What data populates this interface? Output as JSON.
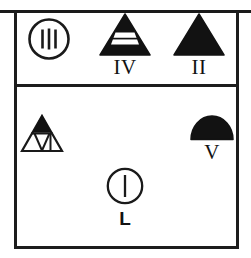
{
  "figure": {
    "type": "symbol-typology-plate",
    "background_color": "#ffffff",
    "ink_color": "#1a1a1a",
    "frame": {
      "name": "outer-frame",
      "has_top_rule": true,
      "has_middle_divider": true,
      "sections": [
        "upper-register",
        "lower-register"
      ]
    },
    "symbols": [
      {
        "id": "iii",
        "glyph": "circle-with-three-bars",
        "label": "",
        "label_style": "none",
        "fill": "outline",
        "register": "upper",
        "bar_count": 3
      },
      {
        "id": "iv",
        "glyph": "triangle-with-white-band",
        "label": "IV",
        "label_style": "serif",
        "fill": "solid-black-with-void-band",
        "register": "upper"
      },
      {
        "id": "ii",
        "glyph": "solid-triangle",
        "label": "II",
        "label_style": "serif",
        "fill": "solid-black",
        "register": "upper"
      },
      {
        "id": "nested",
        "glyph": "triangle-with-inscribed-triangles",
        "label": "",
        "label_style": "none",
        "fill": "outline-with-black-apex",
        "register": "lower"
      },
      {
        "id": "v",
        "glyph": "solid-semicircle-dome",
        "label": "V",
        "label_style": "serif",
        "fill": "solid-black",
        "register": "lower"
      },
      {
        "id": "l",
        "glyph": "circle-with-one-bar",
        "label": "L",
        "label_style": "sans-bold",
        "fill": "outline",
        "register": "lower",
        "bar_count": 1
      }
    ]
  }
}
